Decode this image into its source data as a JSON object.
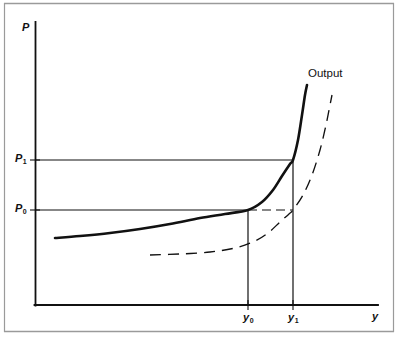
{
  "figure": {
    "background_color": "#ffffff",
    "line_color": "#111111",
    "border_color": "#9a9a9a"
  },
  "axes": {
    "y_axis_label": "P",
    "x_axis_label": "y",
    "y_tick_labels": [
      {
        "base": "P",
        "sub": "1"
      },
      {
        "base": "P",
        "sub": "0"
      }
    ],
    "x_tick_labels": [
      {
        "base": "y",
        "sub": "0"
      },
      {
        "base": "y",
        "sub": "1"
      }
    ]
  },
  "annotations": {
    "output_curve_label": "Output"
  },
  "chart_data": {
    "type": "line",
    "title": "",
    "subtitle": "",
    "xlabel": "y",
    "ylabel": "P",
    "grid": false,
    "legend_position": "none",
    "axis_origin_px": {
      "x": 35,
      "y": 305
    },
    "axis_extent_px": {
      "x_max": 378,
      "y_min": 22
    },
    "xlim_px": [
      35,
      378
    ],
    "ylim_px": [
      305,
      22
    ],
    "annotations": [
      {
        "text": "Output",
        "x_px": 310,
        "y_px": 75,
        "target": "solid-output-curve"
      }
    ],
    "reference_lines": [
      {
        "name": "P1-horizontal",
        "axis": "horizontal",
        "value_label": "P1",
        "y_px": 160,
        "x_start_px": 35,
        "x_end_px": 293,
        "style": "solid"
      },
      {
        "name": "P0-horizontal-solid",
        "axis": "horizontal",
        "value_label": "P0",
        "y_px": 210,
        "x_start_px": 35,
        "x_end_px": 248,
        "style": "solid"
      },
      {
        "name": "P0-horizontal-dashed",
        "axis": "horizontal",
        "value_label": "P0",
        "y_px": 210,
        "x_start_px": 248,
        "x_end_px": 293,
        "style": "dashed"
      },
      {
        "name": "y0-vertical",
        "axis": "vertical",
        "value_label": "y0",
        "x_px": 248,
        "y_start_px": 210,
        "y_end_px": 305,
        "style": "solid"
      },
      {
        "name": "y1-vertical",
        "axis": "vertical",
        "value_label": "y1",
        "x_px": 293,
        "y_start_px": 160,
        "y_end_px": 305,
        "style": "solid"
      }
    ],
    "series": [
      {
        "name": "Output",
        "style": "solid",
        "linewidth": 2.6,
        "description": "Upward-sloping aggregate supply / output price curve, flat at low output and rising steeply near capacity",
        "points_px": [
          [
            55,
            238
          ],
          [
            80,
            236
          ],
          [
            110,
            233
          ],
          [
            140,
            229
          ],
          [
            170,
            224
          ],
          [
            200,
            218
          ],
          [
            225,
            214
          ],
          [
            248,
            210
          ],
          [
            262,
            202
          ],
          [
            273,
            190
          ],
          [
            282,
            176
          ],
          [
            290,
            164
          ],
          [
            293,
            160
          ],
          [
            298,
            140
          ],
          [
            302,
            115
          ],
          [
            305,
            95
          ],
          [
            307,
            85
          ]
        ]
      },
      {
        "name": "Shifted output",
        "style": "dashed",
        "linewidth": 1.3,
        "description": "Same curve shifted to the right, intersecting P0 at y1",
        "points_px": [
          [
            150,
            255
          ],
          [
            180,
            254
          ],
          [
            210,
            252
          ],
          [
            235,
            248
          ],
          [
            255,
            241
          ],
          [
            268,
            233
          ],
          [
            280,
            222
          ],
          [
            289,
            214
          ],
          [
            293,
            210
          ],
          [
            303,
            195
          ],
          [
            312,
            175
          ],
          [
            320,
            150
          ],
          [
            326,
            125
          ],
          [
            330,
            105
          ],
          [
            332,
            95
          ]
        ]
      }
    ],
    "key_points_px": [
      {
        "name": "solid-curve-at-P0",
        "x": 248,
        "y": 210,
        "labels": [
          "y0",
          "P0"
        ]
      },
      {
        "name": "solid-curve-at-P1",
        "x": 293,
        "y": 160,
        "labels": [
          "y1",
          "P1"
        ]
      },
      {
        "name": "dashed-curve-at-P0",
        "x": 293,
        "y": 210,
        "labels": [
          "y1",
          "P0"
        ]
      }
    ]
  }
}
